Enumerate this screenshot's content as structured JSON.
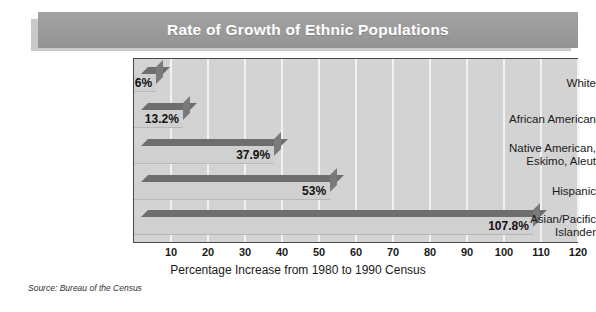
{
  "chart_data": {
    "type": "bar",
    "orientation": "horizontal",
    "title": "Rate of Growth of Ethnic Populations",
    "xlabel": "Percentage Increase from 1980 to 1990 Census",
    "ylabel": "",
    "categories": [
      "White",
      "African American",
      "Native American,\nEskimo, Aleut",
      "Hispanic",
      "Asian/Pacific\nIslander"
    ],
    "values": [
      6,
      13.2,
      37.9,
      53,
      107.8
    ],
    "value_labels": [
      "6%",
      "13.2%",
      "37.9%",
      "53%",
      "107.8%"
    ],
    "xlim": [
      0,
      127
    ],
    "xticks": [
      10,
      20,
      30,
      40,
      50,
      60,
      70,
      80,
      90,
      100,
      110,
      120
    ],
    "xtick_labels": [
      "10",
      "20",
      "30",
      "40",
      "50",
      "60",
      "70",
      "80",
      "90",
      "100",
      "110",
      "120"
    ],
    "grid": "vertical-only",
    "legend": "none",
    "source": "Source: Bureau of the Census",
    "colors": {
      "title_bar": "#9a9a9a",
      "title_text": "#ffffff",
      "plot_background": "#d3d3d3",
      "gridline": "#f2f2f2",
      "bar_face": "#d0d0d0",
      "bar_top": "#6e6e6e",
      "bar_cap": "#7a7a7a",
      "frame": "#4a4a4a",
      "text": "#1a1a1a"
    }
  }
}
